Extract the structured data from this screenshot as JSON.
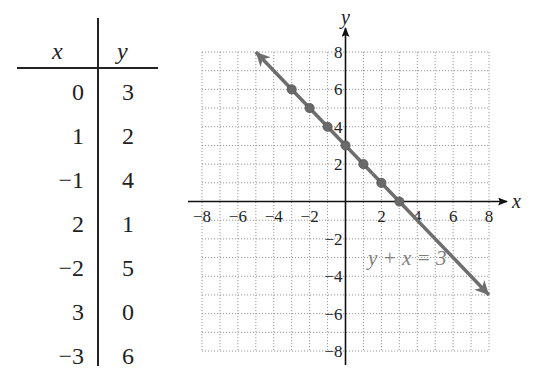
{
  "table": {
    "headers": {
      "x": "x",
      "y": "y"
    },
    "rows": [
      {
        "x": "0",
        "y": "3"
      },
      {
        "x": "1",
        "y": "2"
      },
      {
        "x": "−1",
        "y": "4"
      },
      {
        "x": "2",
        "y": "1"
      },
      {
        "x": "−2",
        "y": "5"
      },
      {
        "x": "3",
        "y": "0"
      },
      {
        "x": "−3",
        "y": "6"
      }
    ]
  },
  "graph": {
    "x_axis_label": "x",
    "y_axis_label": "y",
    "x_ticks": [
      "−8",
      "−6",
      "−4",
      "−2",
      "2",
      "4",
      "6",
      "8"
    ],
    "y_ticks": [
      "8",
      "6",
      "4",
      "2",
      "−2",
      "−4",
      "−6",
      "−8"
    ],
    "equation_label": "y + x = 3",
    "line_color": "#6e6e6e",
    "grid_color": "#9a9a9a"
  },
  "chart_data": {
    "type": "line",
    "title": "",
    "xlabel": "x",
    "ylabel": "y",
    "xlim": [
      -8,
      8
    ],
    "ylim": [
      -8,
      8
    ],
    "grid": true,
    "x_ticks": [
      -8,
      -6,
      -4,
      -2,
      2,
      4,
      6,
      8
    ],
    "y_ticks": [
      -8,
      -6,
      -4,
      -2,
      2,
      4,
      6,
      8
    ],
    "series": [
      {
        "name": "y + x = 3",
        "kind": "line",
        "extends_from": [
          -5,
          8
        ],
        "extends_to": [
          8,
          -5
        ],
        "arrows": "both"
      },
      {
        "name": "plotted points",
        "kind": "scatter",
        "points": [
          [
            0,
            3
          ],
          [
            1,
            2
          ],
          [
            -1,
            4
          ],
          [
            2,
            1
          ],
          [
            -2,
            5
          ],
          [
            3,
            0
          ],
          [
            -3,
            6
          ]
        ]
      }
    ],
    "annotations": [
      {
        "text": "y + x = 3",
        "x": 3.5,
        "y": -3
      }
    ],
    "table": {
      "columns": [
        "x",
        "y"
      ],
      "rows": [
        [
          0,
          3
        ],
        [
          1,
          2
        ],
        [
          -1,
          4
        ],
        [
          2,
          1
        ],
        [
          -2,
          5
        ],
        [
          3,
          0
        ],
        [
          -3,
          6
        ]
      ]
    }
  }
}
